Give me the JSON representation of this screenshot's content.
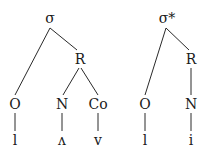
{
  "trees": [
    {
      "name": "syllable-1",
      "nodes": {
        "root": {
          "label": "σ",
          "x": 50,
          "y": 23
        },
        "rime": {
          "label": "R",
          "x": 80,
          "y": 63
        },
        "onset": {
          "label": "O",
          "x": 15,
          "y": 108
        },
        "nucleus": {
          "label": "N",
          "x": 62,
          "y": 108
        },
        "coda": {
          "label": "Co",
          "x": 98,
          "y": 108
        },
        "seg_onset": {
          "label": "l",
          "x": 15,
          "y": 145
        },
        "seg_nucleus": {
          "label": "ʌ",
          "x": 62,
          "y": 145
        },
        "seg_coda": {
          "label": "v",
          "x": 98,
          "y": 145
        }
      }
    },
    {
      "name": "syllable-2",
      "nodes": {
        "root": {
          "label": "σ*",
          "x": 167,
          "y": 23
        },
        "rime": {
          "label": "R",
          "x": 191,
          "y": 63
        },
        "onset": {
          "label": "O",
          "x": 145,
          "y": 108
        },
        "nucleus": {
          "label": "N",
          "x": 191,
          "y": 108
        },
        "seg_onset": {
          "label": "l",
          "x": 145,
          "y": 145
        },
        "seg_nucleus": {
          "label": "i",
          "x": 191,
          "y": 145
        }
      }
    }
  ]
}
